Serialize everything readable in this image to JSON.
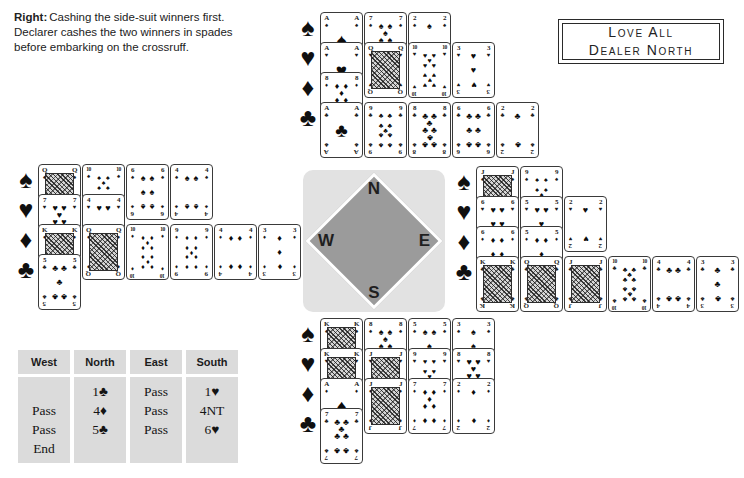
{
  "caption": {
    "lead": "Right:",
    "text": "Cashing the side-suit winners first. Declarer cashes the two winners in spades before embarking on the crossruff."
  },
  "vulnerability_box": {
    "line1": "Love All",
    "line2": "Dealer North"
  },
  "compass": {
    "north": "N",
    "east": "E",
    "south": "S",
    "west": "W"
  },
  "suits": {
    "spades": "♠",
    "hearts": "♥",
    "diamonds": "♦",
    "clubs": "♣"
  },
  "hands": {
    "north": {
      "spades": [
        "A",
        "7",
        "2"
      ],
      "hearts": [
        "A",
        "Q",
        "10",
        "3"
      ],
      "diamonds": [
        "8"
      ],
      "clubs": [
        "A",
        "9",
        "8",
        "6",
        "2"
      ]
    },
    "east": {
      "spades": [
        "J",
        "9"
      ],
      "hearts": [
        "6",
        "5",
        "2"
      ],
      "diamonds": [
        "6",
        "5"
      ],
      "clubs": [
        "K",
        "Q",
        "J",
        "10",
        "4",
        "3"
      ]
    },
    "south": {
      "spades": [
        "K",
        "8",
        "5",
        "3"
      ],
      "hearts": [
        "K",
        "J",
        "9",
        "8"
      ],
      "diamonds": [
        "A",
        "J",
        "7",
        "2"
      ],
      "clubs": [
        "7"
      ]
    },
    "west": {
      "spades": [
        "Q",
        "10",
        "6",
        "4"
      ],
      "hearts": [
        "7",
        "4"
      ],
      "diamonds": [
        "K",
        "Q",
        "10",
        "9",
        "4",
        "3"
      ],
      "clubs": [
        "5"
      ]
    }
  },
  "bidding": {
    "headers": [
      "West",
      "North",
      "East",
      "South"
    ],
    "rows": [
      [
        "",
        "1♣",
        "Pass",
        "1♥"
      ],
      [
        "Pass",
        "4♦",
        "Pass",
        "4NT"
      ],
      [
        "Pass",
        "5♣",
        "Pass",
        "6♥"
      ],
      [
        "End",
        "",
        "",
        ""
      ]
    ]
  },
  "colors": {
    "page_bg": "#ffffff",
    "ink": "#1a1a1a",
    "card_border": "#3a3a3a",
    "compass_square": "#e2e2e2",
    "compass_diamond": "#9b9b9b",
    "compass_letter": "#1f1f1f",
    "table_cell": "#dbdbdb"
  }
}
